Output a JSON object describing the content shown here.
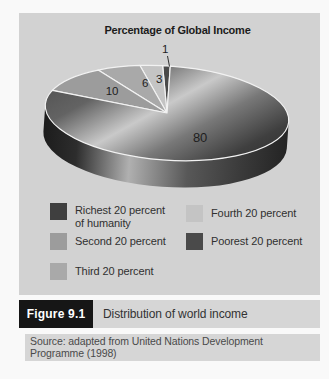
{
  "chart_data": {
    "type": "pie",
    "style": "3d",
    "title": "Percentage of Global Income",
    "total": 100,
    "slices": [
      {
        "label": "Richest 20 percent of humanity",
        "value": 80,
        "color": "#3f3f3f"
      },
      {
        "label": "Second 20 percent",
        "value": 10,
        "color": "#9c9c9c"
      },
      {
        "label": "Third 20 percent",
        "value": 6,
        "color": "#a9a9a9"
      },
      {
        "label": "Fourth 20 percent",
        "value": 3,
        "color": "#c4c4c4"
      },
      {
        "label": "Poorest 20 percent",
        "value": 1,
        "color": "#4a4a4a"
      }
    ],
    "legend_position": "bottom",
    "value_labels": [
      80,
      10,
      6,
      3,
      1
    ]
  },
  "caption": {
    "figure_label": "Figure 9.1",
    "title": "Distribution of world income"
  },
  "source": {
    "text": "Source: adapted from United Nations Development Programme (1998)"
  },
  "theme": {
    "page_bg": "#f9f9f9",
    "panel_bg": "#d2d2d2",
    "caption_bar_bg": "#d6d6d6",
    "figure_badge_bg": "#161616",
    "figure_badge_text": "#ffffff",
    "slice_separator": "#f2f2f2"
  }
}
